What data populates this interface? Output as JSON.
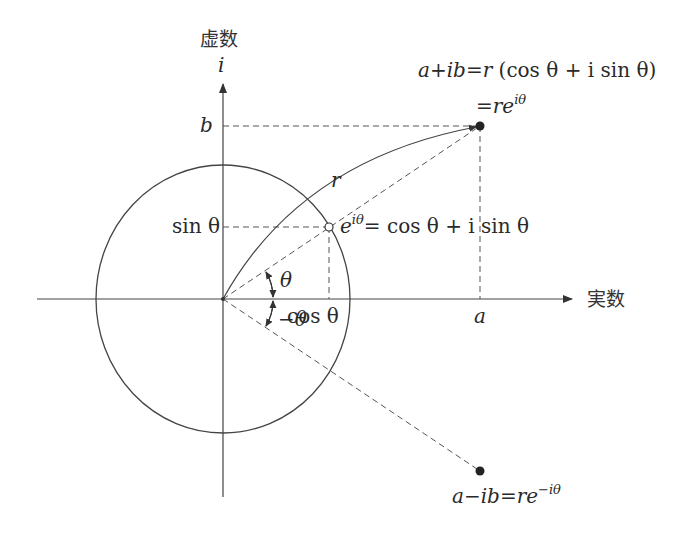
{
  "axes": {
    "imaginary_label": "虚数",
    "imaginary_symbol": "i",
    "real_label": "実数"
  },
  "ticks": {
    "b": "b",
    "sin_theta": "sin θ",
    "cos_theta": "cos θ",
    "a": "a"
  },
  "labels": {
    "r": "r",
    "theta": "θ",
    "neg_theta": "−θ"
  },
  "formulas": {
    "polar_line1": "a + ib = r (cos θ + i sin θ)",
    "polar_line1_parts": {
      "lhs": "a+ib",
      "eq": "=",
      "r": "r",
      "paren": "(cos θ + i sin θ)"
    },
    "polar_line2": "= re^{iθ}",
    "polar_line2_parts": {
      "eq": "=",
      "base": "re",
      "exp": "iθ"
    },
    "euler": "e^{iθ} = cos θ + i sin θ",
    "euler_parts": {
      "base": "e",
      "exp": "iθ",
      "rhs": "= cos θ + i sin θ"
    },
    "conjugate": "a − ib = re^{−iθ}",
    "conjugate_parts": {
      "lhs": "a−ib",
      "eq": "=",
      "base": "re",
      "exp": "−iθ"
    }
  },
  "points": [
    {
      "name": "a+ib",
      "style": "filled"
    },
    {
      "name": "e^{iθ}",
      "style": "open"
    },
    {
      "name": "a−ib",
      "style": "filled"
    }
  ],
  "colors": {
    "ink": "#333333",
    "background": "#ffffff"
  }
}
